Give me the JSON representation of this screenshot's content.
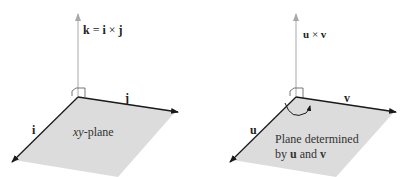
{
  "panels": [
    {
      "id": "standard-basis",
      "normal_label": {
        "a": "k",
        "eq": " = ",
        "b": "i",
        "op": " × ",
        "c": "j"
      },
      "axis_x_label": "i",
      "axis_y_label": "j",
      "plane_label": {
        "prefix": "xy",
        "suffix": "-plane"
      }
    },
    {
      "id": "general-vectors",
      "normal_label": {
        "a": "u",
        "op": " × ",
        "b": "v"
      },
      "axis_x_label": "u",
      "axis_y_label": "v",
      "plane_label": {
        "line1": "Plane determined",
        "line2_prefix": "by ",
        "line2_a": "u",
        "line2_mid": " and ",
        "line2_b": "v"
      }
    }
  ],
  "colors": {
    "plane_fill": "#dcdcdc",
    "axis_dark": "#1a1a1a",
    "normal_axis": "#a8a8a8",
    "text": "#222222"
  }
}
